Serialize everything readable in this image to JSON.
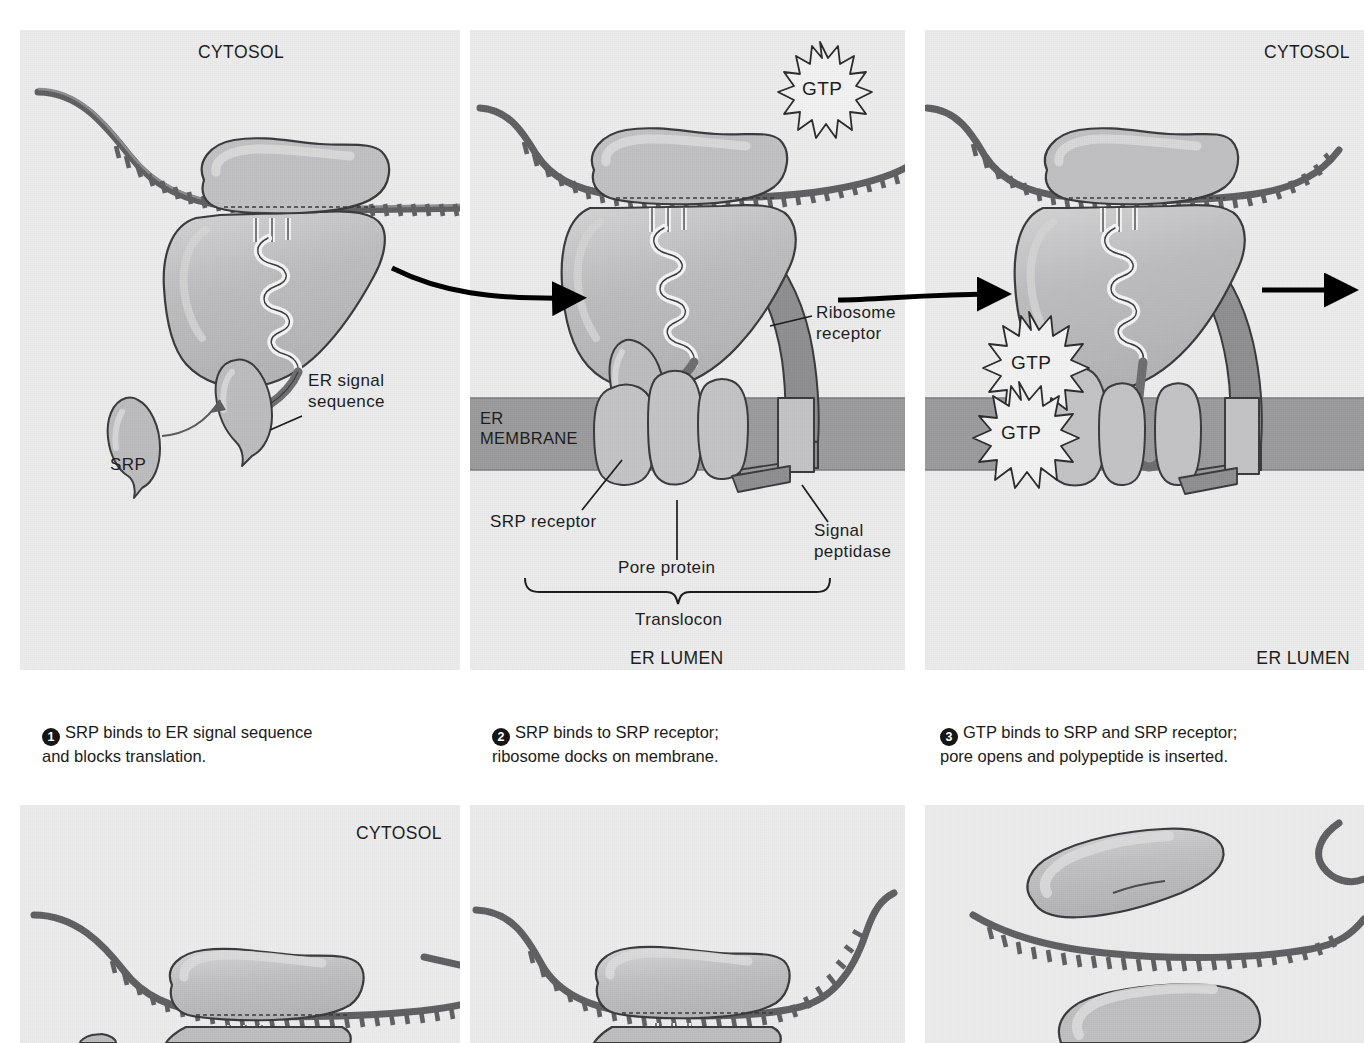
{
  "figure": {
    "colors": {
      "panel_background": "#ececed",
      "membrane_band": "#9b9b9d",
      "ribosome_fill": "#b9b9bb",
      "ribosome_highlight": "#d2d2d3",
      "translocon_fill": "#c3c3c5",
      "receptor_dark": "#8f8f92",
      "outline": "#3a3a3c",
      "mrna_stroke": "#6b6b6e",
      "text": "#1a1a1a",
      "arrow": "#000000"
    }
  },
  "panels": [
    {
      "id": "panel-1",
      "compartment_top": "CYTOSOL",
      "compartment_bottom": "",
      "labels": [
        {
          "name": "er-signal-sequence",
          "text": "ER signal\nsequence"
        },
        {
          "name": "srp",
          "text": "SRP"
        }
      ],
      "gtp_markers": []
    },
    {
      "id": "panel-2",
      "compartment_top": "",
      "compartment_bottom": "ER LUMEN",
      "membrane_label": "ER\nMEMBRANE",
      "labels": [
        {
          "name": "ribosome-receptor",
          "text": "Ribosome\nreceptor"
        },
        {
          "name": "srp-receptor",
          "text": "SRP receptor"
        },
        {
          "name": "pore-protein",
          "text": "Pore protein"
        },
        {
          "name": "signal-peptidase",
          "text": "Signal\npeptidase"
        },
        {
          "name": "translocon",
          "text": "Translocon"
        }
      ],
      "gtp_markers": [
        "GTP"
      ]
    },
    {
      "id": "panel-3",
      "compartment_top": "CYTOSOL",
      "compartment_bottom": "ER LUMEN",
      "labels": [],
      "gtp_markers": [
        "GTP",
        "GTP"
      ]
    },
    {
      "id": "panel-4",
      "compartment_top": "CYTOSOL",
      "compartment_bottom": "",
      "labels": [],
      "gtp_markers": []
    },
    {
      "id": "panel-5",
      "compartment_top": "",
      "compartment_bottom": "",
      "labels": [],
      "gtp_markers": []
    },
    {
      "id": "panel-6",
      "compartment_top": "",
      "compartment_bottom": "",
      "labels": [],
      "gtp_markers": []
    }
  ],
  "captions": [
    {
      "number": "1",
      "text": "SRP binds to ER signal sequence\nand blocks translation."
    },
    {
      "number": "2",
      "text": "SRP binds to SRP receptor;\nribosome docks on membrane."
    },
    {
      "number": "3",
      "text": "GTP binds to SRP and SRP receptor;\npore opens and polypeptide is inserted."
    }
  ]
}
